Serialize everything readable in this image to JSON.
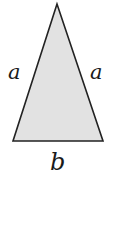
{
  "diagram": {
    "shape": "isosceles-triangle",
    "fill_color": "#e2e2e2",
    "stroke_color": "#222222",
    "vertices": {
      "apex": [
        57,
        4
      ],
      "bottom_left": [
        13,
        141
      ],
      "bottom_right": [
        103,
        141
      ]
    },
    "labels": {
      "left_side": "a",
      "right_side": "a",
      "base": "b"
    }
  }
}
